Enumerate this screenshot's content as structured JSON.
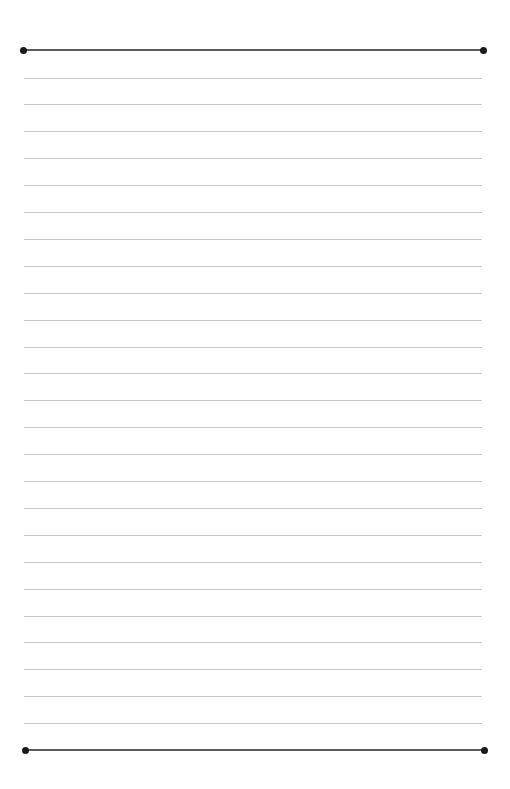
{
  "page": {
    "type": "lined-paper",
    "background": "#ffffff",
    "top_border": {
      "y": 50,
      "x1": 23,
      "x2": 483,
      "color": "#5a5a5a"
    },
    "bottom_border": {
      "y": 750,
      "x1": 25,
      "x2": 484,
      "color": "#5a5a5a"
    },
    "dot_color": "#1a1a1a",
    "rules": {
      "count": 25,
      "first_y": 77.5,
      "spacing": 26.9,
      "x1": 24,
      "x2": 482,
      "color": "#c8c8c8"
    }
  }
}
